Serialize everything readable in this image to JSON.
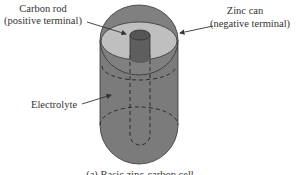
{
  "diagram": {
    "labels": {
      "carbon_rod_line1": "Carbon rod",
      "carbon_rod_line2": "(positive terminal)",
      "zinc_can_line1": "Zinc can",
      "zinc_can_line2": "(negative terminal)",
      "electrolyte": "Electrolyte"
    },
    "caption": "(a) Basic zinc-carbon cell",
    "colors": {
      "can_body": "#7a7a7a",
      "inner_top": "#bdbdbd",
      "rod": "#5a5a5a",
      "outline": "#333333"
    }
  }
}
